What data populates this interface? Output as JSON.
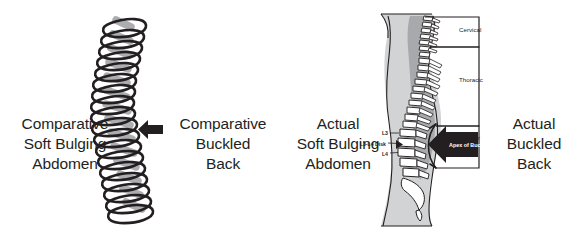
{
  "figure": {
    "background_color": "#ffffff",
    "ink_color": "#231f20",
    "shadow_color": "#a7a9ac",
    "body_fill": "#bcbec0",
    "bone_fill": "#ffffff"
  },
  "captions": {
    "comparative_abdomen": "Comparative\nSoft Bulging\nAbdomen",
    "comparative_back": "Comparative\nBuckled\nBack",
    "actual_abdomen": "Actual\nSoft Bulging\nAbdomen",
    "actual_back": "Actual\nBuckled\nBack"
  },
  "spine_labels": {
    "l3": "L3",
    "disk": "L3-L4 Disk",
    "l4": "L4",
    "apex": "Apex of Buckle",
    "cervical": "Cervical",
    "thoracic": "Thoracic",
    "lumbar": "Lumbar"
  },
  "icons": {
    "comparative_arrow": "arrow-left-icon",
    "apex_arrow": "arrow-left-icon",
    "spring": "coil-spring-icon",
    "spine": "lateral-spine-anatomy-icon",
    "region_bracket": "region-bracket-icon"
  }
}
